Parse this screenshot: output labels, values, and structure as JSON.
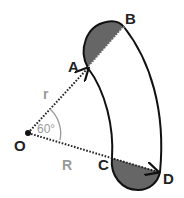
{
  "diagram": {
    "type": "geometry",
    "points": {
      "O": "O",
      "A": "A",
      "B": "B",
      "C": "C",
      "D": "D"
    },
    "labels": {
      "inner_radius": "r",
      "outer_radius": "R",
      "angle": "60°"
    },
    "colors": {
      "outline": "#111111",
      "shaded": "#666666",
      "dim_label": "#9a9a9a",
      "point_label": "#222222"
    }
  }
}
